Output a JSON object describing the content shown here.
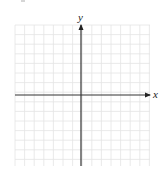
{
  "diagram": {
    "type": "coordinate-plane",
    "x_axis_label": "x",
    "y_axis_label": "y",
    "grid": {
      "left": 15,
      "top": 25,
      "right": 150,
      "bottom": 166,
      "cell_size": 9.6,
      "color": "#e4e4e4"
    },
    "origin": {
      "x": 81,
      "y": 95
    },
    "axis_color": "#333333"
  }
}
